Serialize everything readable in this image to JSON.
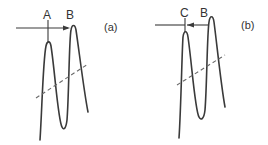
{
  "panels": [
    {
      "id": "a",
      "caption": "(a)",
      "peak_labels": [
        "A",
        "B"
      ],
      "arrow_direction": "right"
    },
    {
      "id": "b",
      "caption": "(b)",
      "peak_labels": [
        "C",
        "B"
      ],
      "arrow_direction": "left"
    }
  ],
  "colors": {
    "line": "#3a3a3a",
    "dashed": "#6a6a6a",
    "background": "#ffffff"
  }
}
